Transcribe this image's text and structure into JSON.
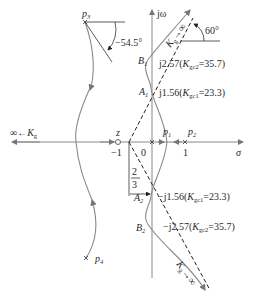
{
  "diagram": {
    "type": "root-locus",
    "axes": {
      "imag_label": "jω",
      "real_label": "σ",
      "origin_label": "0"
    },
    "zero": {
      "name": "z",
      "value_label": "−1"
    },
    "poles": [
      {
        "name": "p1",
        "base": "p",
        "sub": "1"
      },
      {
        "name": "p2",
        "base": "p",
        "sub": "2",
        "value_label": "1"
      },
      {
        "name": "p3",
        "base": "p",
        "sub": "3"
      },
      {
        "name": "p4",
        "base": "p",
        "sub": "4"
      }
    ],
    "asymptote_centroid": {
      "num": "2",
      "den": "3"
    },
    "angles": {
      "asymptote": "60°",
      "departure_p3": "−54.5°"
    },
    "points": {
      "A1": {
        "base": "A",
        "sub": "1",
        "text_pre": "j1.56(",
        "k": "K",
        "ksub": "gc1",
        "text_post": "=23.3)"
      },
      "B1": {
        "base": "B",
        "sub": "1",
        "text_pre": "j2.57(",
        "k": "K",
        "ksub": "gc2",
        "text_post": "=35.7)"
      },
      "A2": {
        "base": "A",
        "sub": "2",
        "text_pre": "−j1.56(",
        "k": "K",
        "ksub": "gc1",
        "text_post": "=23.3)"
      },
      "B2": {
        "base": "B",
        "sub": "2",
        "text_pre": "−j2.57(",
        "k": "K",
        "ksub": "gc2",
        "text_post": "=35.7)"
      }
    },
    "gain_labels": {
      "left": {
        "pre": "∞←",
        "k": "K",
        "sub": "g"
      },
      "upper": {
        "k": "K",
        "sub": "g",
        "post": "→∞"
      },
      "lower": {
        "k": "K",
        "sub": "g",
        "post": "→∞"
      }
    }
  }
}
